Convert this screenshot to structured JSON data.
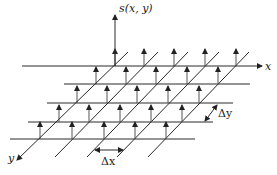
{
  "diagram": {
    "type": "2d-sampling-grid",
    "stroke_color": "#2a2a2a",
    "arrow_color": "#222222",
    "background": "#ffffff",
    "labels": {
      "s_axis": "s(x, y)",
      "x_axis": "x",
      "y_axis": "y",
      "delta_x": "Δx",
      "delta_y": "Δy"
    },
    "s_axis": {
      "x": 115,
      "y_base": 66,
      "y_tip": 15,
      "label_x": 119,
      "label_y": 12
    },
    "x_axis": {
      "y": 66,
      "x_start": 22,
      "x_tip": 262,
      "label_x": 265,
      "label_y": 70
    },
    "y_axis": {
      "x_top": 128,
      "y_top": 52,
      "x_tip": 17,
      "y_tip": 160,
      "label_x": 8,
      "label_y": 162
    },
    "rows": [
      {
        "y": 66,
        "x_start": 22,
        "x_end": 262,
        "arrows_x": [
          115,
          144,
          174,
          205,
          236
        ]
      },
      {
        "y": 84,
        "x_start": 64,
        "x_end": 250,
        "arrows_x": [
          96,
          126,
          156,
          187,
          218
        ]
      },
      {
        "y": 103,
        "x_start": 47,
        "x_end": 233,
        "arrows_x": [
          77,
          107,
          137,
          168,
          199
        ]
      },
      {
        "y": 122,
        "x_start": 28,
        "x_end": 213,
        "arrows_x": [
          59,
          89,
          120,
          151,
          182
        ]
      },
      {
        "y": 139,
        "x_start": 10,
        "x_end": 195,
        "arrows_x": [
          40,
          72,
          104,
          135,
          166
        ]
      }
    ],
    "arrow_height": 17,
    "diagonals": [
      {
        "x1": 128,
        "y1": 52,
        "x2": 17,
        "y2": 160
      },
      {
        "x1": 158,
        "y1": 52,
        "x2": 55,
        "y2": 157
      },
      {
        "x1": 188,
        "y1": 52,
        "x2": 87,
        "y2": 157
      },
      {
        "x1": 219,
        "y1": 52,
        "x2": 117,
        "y2": 157
      },
      {
        "x1": 249,
        "y1": 52,
        "x2": 148,
        "y2": 157
      }
    ],
    "delta_x_marker": {
      "x1": 95,
      "x2": 123,
      "y": 150,
      "label_x": 101,
      "label_y": 165
    },
    "delta_y_marker": {
      "x1": 205,
      "y1": 121,
      "x2": 217,
      "y2": 105,
      "label_x": 218,
      "label_y": 117
    }
  }
}
